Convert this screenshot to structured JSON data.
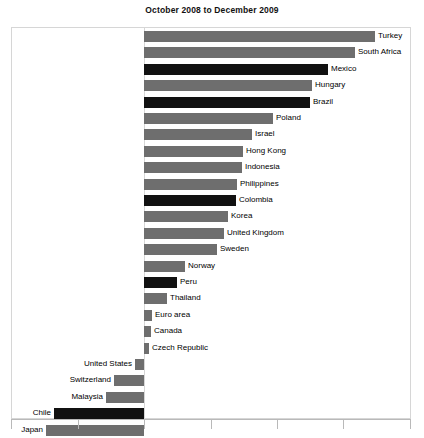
{
  "chart": {
    "title": "October 2008 to December 2009",
    "colors": {
      "bar_gray": "#6e6e6e",
      "bar_black": "#111111",
      "frame": "#d6d6d6",
      "axis": "#b9b9b9",
      "text": "#000000",
      "background": "#ffffff"
    }
  },
  "chart_data": {
    "type": "bar",
    "orientation": "horizontal",
    "title": "October 2008 to December 2009",
    "xlabel": "",
    "ylabel": "",
    "grid": false,
    "legend": null,
    "axis": {
      "zero_at_px": 144,
      "tick_px": [
        11,
        78,
        144,
        211,
        277,
        343,
        410
      ],
      "tick_labels": [
        "",
        "",
        "",
        "",
        "",
        "",
        ""
      ],
      "xlim_px": [
        11,
        411
      ]
    },
    "categories": [
      "Turkey",
      "South Africa",
      "Mexico",
      "Hungary",
      "Brazil",
      "Poland",
      "Israel",
      "Hong Kong",
      "Indonesia",
      "Philippines",
      "Colombia",
      "Korea",
      "United Kingdom",
      "Sweden",
      "Norway",
      "Peru",
      "Thailand",
      "Euro area",
      "Canada",
      "Czech Republic",
      "United States",
      "Switzerland",
      "Malaysia",
      "Chile",
      "Japan"
    ],
    "values_px": [
      231,
      211,
      184,
      168,
      166,
      129,
      108,
      99,
      98,
      93,
      92,
      84,
      80,
      73,
      41,
      33,
      23,
      8,
      7,
      5,
      -9,
      -30,
      -38,
      -90,
      -98
    ],
    "highlight": [
      false,
      false,
      true,
      false,
      true,
      false,
      false,
      false,
      false,
      false,
      true,
      false,
      false,
      false,
      false,
      true,
      false,
      false,
      false,
      false,
      false,
      false,
      false,
      true,
      false
    ],
    "bars": [
      {
        "label": "Turkey",
        "value_px": 231,
        "sign": "positive",
        "color": "gray"
      },
      {
        "label": "South Africa",
        "value_px": 211,
        "sign": "positive",
        "color": "gray"
      },
      {
        "label": "Mexico",
        "value_px": 184,
        "sign": "positive",
        "color": "black"
      },
      {
        "label": "Hungary",
        "value_px": 168,
        "sign": "positive",
        "color": "gray"
      },
      {
        "label": "Brazil",
        "value_px": 166,
        "sign": "positive",
        "color": "black"
      },
      {
        "label": "Poland",
        "value_px": 129,
        "sign": "positive",
        "color": "gray"
      },
      {
        "label": "Israel",
        "value_px": 108,
        "sign": "positive",
        "color": "gray"
      },
      {
        "label": "Hong Kong",
        "value_px": 99,
        "sign": "positive",
        "color": "gray"
      },
      {
        "label": "Indonesia",
        "value_px": 98,
        "sign": "positive",
        "color": "gray"
      },
      {
        "label": "Philippines",
        "value_px": 93,
        "sign": "positive",
        "color": "gray"
      },
      {
        "label": "Colombia",
        "value_px": 92,
        "sign": "positive",
        "color": "black"
      },
      {
        "label": "Korea",
        "value_px": 84,
        "sign": "positive",
        "color": "gray"
      },
      {
        "label": "United Kingdom",
        "value_px": 80,
        "sign": "positive",
        "color": "gray"
      },
      {
        "label": "Sweden",
        "value_px": 73,
        "sign": "positive",
        "color": "gray"
      },
      {
        "label": "Norway",
        "value_px": 41,
        "sign": "positive",
        "color": "gray"
      },
      {
        "label": "Peru",
        "value_px": 33,
        "sign": "positive",
        "color": "black"
      },
      {
        "label": "Thailand",
        "value_px": 23,
        "sign": "positive",
        "color": "gray"
      },
      {
        "label": "Euro area",
        "value_px": 8,
        "sign": "positive",
        "color": "gray"
      },
      {
        "label": "Canada",
        "value_px": 7,
        "sign": "positive",
        "color": "gray"
      },
      {
        "label": "Czech Republic",
        "value_px": 5,
        "sign": "positive",
        "color": "gray"
      },
      {
        "label": "United States",
        "value_px": -9,
        "sign": "negative",
        "color": "gray"
      },
      {
        "label": "Switzerland",
        "value_px": -30,
        "sign": "negative",
        "color": "gray"
      },
      {
        "label": "Malaysia",
        "value_px": -38,
        "sign": "negative",
        "color": "gray"
      },
      {
        "label": "Chile",
        "value_px": -90,
        "sign": "negative",
        "color": "black"
      },
      {
        "label": "Japan",
        "value_px": -98,
        "sign": "negative",
        "color": "gray"
      }
    ]
  }
}
